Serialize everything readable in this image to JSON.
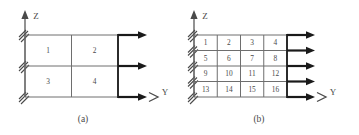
{
  "figure": {
    "stroke_color": "#4a4a4a",
    "bold_stroke_color": "#1a1a1a",
    "background": "#ffffff"
  },
  "panels": [
    {
      "id": "panel-a",
      "caption": "(a)",
      "axis_z_label": "Z",
      "axis_y_label": "Y",
      "grid": {
        "columns": 2,
        "rows": 2,
        "cells": [
          {
            "label": "1",
            "row": 0,
            "col": 0
          },
          {
            "label": "2",
            "row": 0,
            "col": 1
          },
          {
            "label": "3",
            "row": 1,
            "col": 0
          },
          {
            "label": "4",
            "row": 1,
            "col": 1
          }
        ]
      },
      "support_hatch_count": 3,
      "load_arrow_count": 3
    },
    {
      "id": "panel-b",
      "caption": "(b)",
      "axis_z_label": "Z",
      "axis_y_label": "Y",
      "grid": {
        "columns": 4,
        "rows": 4,
        "cells": [
          {
            "label": "1",
            "row": 0,
            "col": 0
          },
          {
            "label": "2",
            "row": 0,
            "col": 1
          },
          {
            "label": "3",
            "row": 0,
            "col": 2
          },
          {
            "label": "4",
            "row": 0,
            "col": 3
          },
          {
            "label": "5",
            "row": 1,
            "col": 0
          },
          {
            "label": "6",
            "row": 1,
            "col": 1
          },
          {
            "label": "7",
            "row": 1,
            "col": 2
          },
          {
            "label": "8",
            "row": 1,
            "col": 3
          },
          {
            "label": "9",
            "row": 2,
            "col": 0
          },
          {
            "label": "10",
            "row": 2,
            "col": 1
          },
          {
            "label": "11",
            "row": 2,
            "col": 2
          },
          {
            "label": "12",
            "row": 2,
            "col": 3
          },
          {
            "label": "13",
            "row": 3,
            "col": 0
          },
          {
            "label": "14",
            "row": 3,
            "col": 1
          },
          {
            "label": "15",
            "row": 3,
            "col": 2
          },
          {
            "label": "16",
            "row": 3,
            "col": 3
          }
        ]
      },
      "support_hatch_count": 5,
      "load_arrow_count": 5
    }
  ]
}
